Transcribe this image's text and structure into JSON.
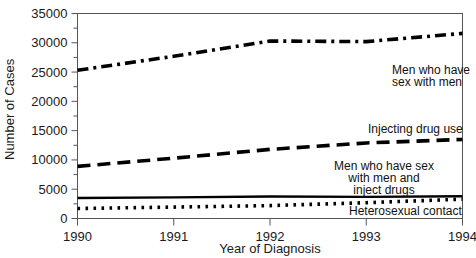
{
  "chart_data": {
    "type": "line",
    "title": "",
    "xlabel": "Year of Diagnosis",
    "ylabel": "Number of Cases",
    "x": [
      1990,
      1991,
      1992,
      1993,
      1994
    ],
    "xticklabels": [
      "1990",
      "1991",
      "1992",
      "1993",
      "1994"
    ],
    "yticklabels": [
      "0",
      "5000",
      "10000",
      "15000",
      "20000",
      "25000",
      "30000",
      "35000"
    ],
    "ytickvalues": [
      0,
      5000,
      10000,
      15000,
      20000,
      25000,
      30000,
      35000
    ],
    "ylim": [
      0,
      35000
    ],
    "xlim": [
      1990,
      1994
    ],
    "grid": false,
    "legend_position": "inline-right-annotations",
    "minor_ticks": true,
    "frame": "box",
    "series": [
      {
        "name": "Men who have sex with men",
        "style": "dash-dot",
        "color": "#000000",
        "values": [
          25300,
          27700,
          30300,
          30200,
          31600
        ],
        "label_text": "Men who have\nsex with men",
        "label_lines": [
          "Men who have",
          "sex with men"
        ]
      },
      {
        "name": "Injecting drug use",
        "style": "dashed",
        "color": "#000000",
        "values": [
          8900,
          10300,
          11800,
          12900,
          13500
        ],
        "label_text": "Injecting drug use",
        "label_lines": [
          "Injecting drug use"
        ]
      },
      {
        "name": "Men who have sex with men and inject drugs",
        "style": "solid",
        "color": "#000000",
        "values": [
          3500,
          3600,
          3750,
          3700,
          3800
        ],
        "label_text": "Men who have sex with men and inject drugs",
        "label_lines": [
          "Men who have sex",
          "with men and",
          "inject drugs"
        ]
      },
      {
        "name": "Heterosexual contact",
        "style": "dotted",
        "color": "#000000",
        "values": [
          1700,
          1950,
          2200,
          2700,
          3300
        ],
        "label_text": "Heterosexual contact",
        "label_lines": [
          "Heterosexual contact"
        ]
      }
    ]
  },
  "axes": {
    "y_title": "Number of Cases",
    "x_title": "Year of Diagnosis"
  },
  "colors": {
    "ink": "#000000",
    "frame": "#444444",
    "text": "#1a1a1a",
    "background": "#ffffff"
  }
}
